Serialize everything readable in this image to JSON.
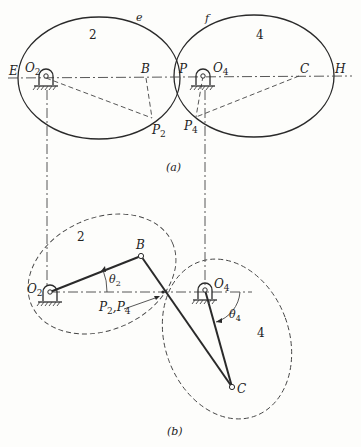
{
  "figure": {
    "part_a": {
      "caption": "(a)",
      "gear_left": {
        "number": "2",
        "curve_label": "e"
      },
      "gear_right": {
        "number": "4",
        "curve_label": "f"
      },
      "labels": {
        "E": "E",
        "O2": "O",
        "O2_sub": "2",
        "B": "B",
        "P": "P",
        "O4": "O",
        "O4_sub": "4",
        "C": "C",
        "H": "H",
        "P2": "P",
        "P2_sub": "2",
        "P4": "P",
        "P4_sub": "4"
      }
    },
    "part_b": {
      "caption": "(b)",
      "gear_left": {
        "number": "2"
      },
      "gear_right": {
        "number": "4"
      },
      "labels": {
        "O2": "O",
        "O2_sub": "2",
        "B": "B",
        "theta2": "θ",
        "theta2_sub": "2",
        "P2P4": "P",
        "P2P4_sub1": "2",
        "P2P4_comma": ",P",
        "P2P4_sub2": "4",
        "O4": "O",
        "O4_sub": "4",
        "theta4": "θ",
        "theta4_sub": "4",
        "C": "C"
      }
    }
  }
}
